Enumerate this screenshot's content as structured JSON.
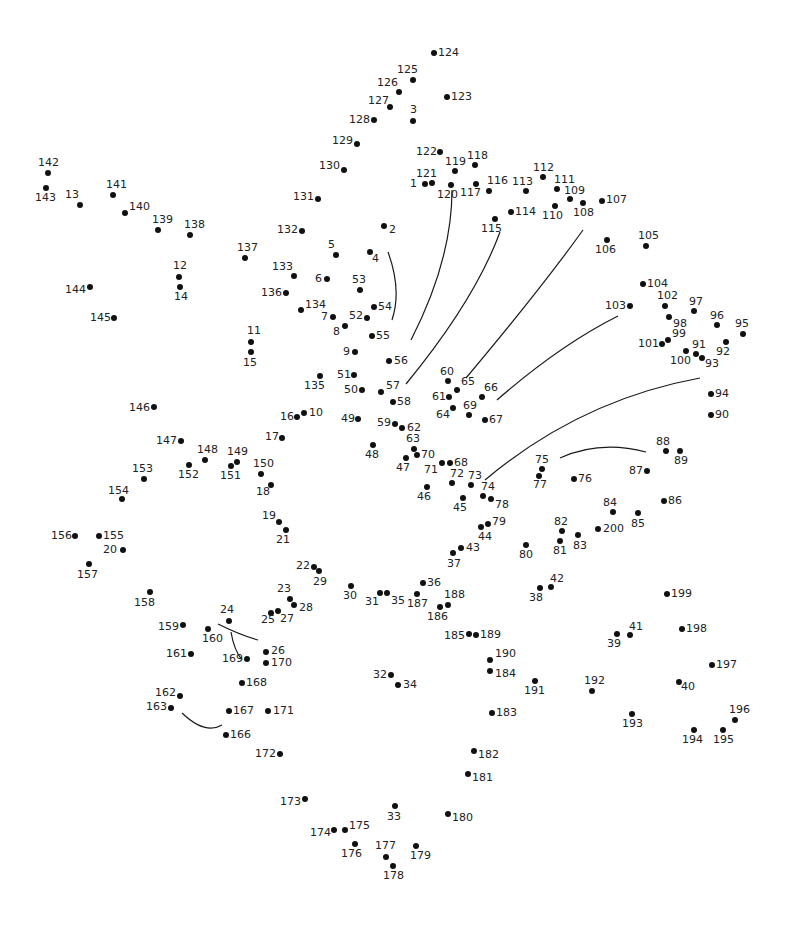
{
  "puzzle": {
    "type": "connect-the-dots",
    "total_points": 200,
    "dot_color": "#111111",
    "line_color": "#1a1a1a",
    "background": "#ffffff"
  },
  "points": [
    {
      "n": "1",
      "x": 425,
      "y": 184,
      "lx": -15,
      "ly": -6
    },
    {
      "n": "2",
      "x": 384,
      "y": 226,
      "lx": 5,
      "ly": -2
    },
    {
      "n": "3",
      "x": 413,
      "y": 121,
      "lx": -3,
      "ly": -17
    },
    {
      "n": "4",
      "x": 370,
      "y": 252,
      "lx": 2,
      "ly": 1
    },
    {
      "n": "5",
      "x": 336,
      "y": 255,
      "lx": -8,
      "ly": -16
    },
    {
      "n": "6",
      "x": 327,
      "y": 279,
      "lx": -12,
      "ly": -6
    },
    {
      "n": "7",
      "x": 333,
      "y": 317,
      "lx": -12,
      "ly": -6
    },
    {
      "n": "8",
      "x": 345,
      "y": 326,
      "lx": -12,
      "ly": 0
    },
    {
      "n": "9",
      "x": 355,
      "y": 352,
      "lx": -12,
      "ly": -6
    },
    {
      "n": "10",
      "x": 304,
      "y": 413,
      "lx": 5,
      "ly": -6
    },
    {
      "n": "11",
      "x": 251,
      "y": 342,
      "lx": -4,
      "ly": -17
    },
    {
      "n": "12",
      "x": 179,
      "y": 277,
      "lx": -6,
      "ly": -17
    },
    {
      "n": "13",
      "x": 80,
      "y": 205,
      "lx": -15,
      "ly": -16
    },
    {
      "n": "14",
      "x": 180,
      "y": 287,
      "lx": -6,
      "ly": 4
    },
    {
      "n": "15",
      "x": 251,
      "y": 352,
      "lx": -8,
      "ly": 5
    },
    {
      "n": "16",
      "x": 297,
      "y": 417,
      "lx": -17,
      "ly": -6
    },
    {
      "n": "17",
      "x": 282,
      "y": 438,
      "lx": -17,
      "ly": -7
    },
    {
      "n": "18",
      "x": 271,
      "y": 485,
      "lx": -15,
      "ly": 1
    },
    {
      "n": "19",
      "x": 279,
      "y": 522,
      "lx": -17,
      "ly": -12
    },
    {
      "n": "20",
      "x": 123,
      "y": 550,
      "lx": -20,
      "ly": -6
    },
    {
      "n": "21",
      "x": 286,
      "y": 530,
      "lx": -10,
      "ly": 4
    },
    {
      "n": "22",
      "x": 314,
      "y": 567,
      "lx": -18,
      "ly": -7
    },
    {
      "n": "23",
      "x": 290,
      "y": 599,
      "lx": -13,
      "ly": -16
    },
    {
      "n": "24",
      "x": 229,
      "y": 621,
      "lx": -9,
      "ly": -17
    },
    {
      "n": "25",
      "x": 271,
      "y": 613,
      "lx": -10,
      "ly": 1
    },
    {
      "n": "26",
      "x": 266,
      "y": 652,
      "lx": 5,
      "ly": -7
    },
    {
      "n": "27",
      "x": 278,
      "y": 611,
      "lx": 2,
      "ly": 2
    },
    {
      "n": "28",
      "x": 294,
      "y": 605,
      "lx": 5,
      "ly": -3
    },
    {
      "n": "29",
      "x": 319,
      "y": 571,
      "lx": -6,
      "ly": 5
    },
    {
      "n": "30",
      "x": 351,
      "y": 586,
      "lx": -8,
      "ly": 4
    },
    {
      "n": "31",
      "x": 380,
      "y": 593,
      "lx": -15,
      "ly": 3
    },
    {
      "n": "32",
      "x": 391,
      "y": 675,
      "lx": -18,
      "ly": -6
    },
    {
      "n": "33",
      "x": 395,
      "y": 806,
      "lx": -8,
      "ly": 5
    },
    {
      "n": "34",
      "x": 398,
      "y": 685,
      "lx": 5,
      "ly": -6
    },
    {
      "n": "35",
      "x": 387,
      "y": 593,
      "lx": 4,
      "ly": 2
    },
    {
      "n": "36",
      "x": 423,
      "y": 583,
      "lx": 4,
      "ly": -6
    },
    {
      "n": "37",
      "x": 453,
      "y": 553,
      "lx": -6,
      "ly": 5
    },
    {
      "n": "38",
      "x": 540,
      "y": 588,
      "lx": -11,
      "ly": 4
    },
    {
      "n": "39",
      "x": 617,
      "y": 634,
      "lx": -10,
      "ly": 4
    },
    {
      "n": "40",
      "x": 679,
      "y": 682,
      "lx": 2,
      "ly": -1
    },
    {
      "n": "41",
      "x": 630,
      "y": 635,
      "lx": -1,
      "ly": -14
    },
    {
      "n": "42",
      "x": 551,
      "y": 587,
      "lx": -1,
      "ly": -14
    },
    {
      "n": "43",
      "x": 461,
      "y": 548,
      "lx": 5,
      "ly": -6
    },
    {
      "n": "44",
      "x": 481,
      "y": 527,
      "lx": -3,
      "ly": 4
    },
    {
      "n": "45",
      "x": 463,
      "y": 498,
      "lx": -10,
      "ly": 4
    },
    {
      "n": "46",
      "x": 427,
      "y": 487,
      "lx": -10,
      "ly": 4
    },
    {
      "n": "47",
      "x": 406,
      "y": 458,
      "lx": -10,
      "ly": 4
    },
    {
      "n": "48",
      "x": 373,
      "y": 445,
      "lx": -8,
      "ly": 4
    },
    {
      "n": "49",
      "x": 358,
      "y": 419,
      "lx": -17,
      "ly": -6
    },
    {
      "n": "50",
      "x": 362,
      "y": 390,
      "lx": -18,
      "ly": -6
    },
    {
      "n": "51",
      "x": 354,
      "y": 375,
      "lx": -17,
      "ly": -6
    },
    {
      "n": "52",
      "x": 367,
      "y": 318,
      "lx": -18,
      "ly": -8
    },
    {
      "n": "53",
      "x": 360,
      "y": 290,
      "lx": -8,
      "ly": -16
    },
    {
      "n": "54",
      "x": 374,
      "y": 307,
      "lx": 4,
      "ly": -6
    },
    {
      "n": "55",
      "x": 372,
      "y": 336,
      "lx": 4,
      "ly": -6
    },
    {
      "n": "56",
      "x": 389,
      "y": 361,
      "lx": 5,
      "ly": -6
    },
    {
      "n": "57",
      "x": 381,
      "y": 392,
      "lx": 5,
      "ly": -12
    },
    {
      "n": "58",
      "x": 393,
      "y": 402,
      "lx": 4,
      "ly": -6
    },
    {
      "n": "59",
      "x": 395,
      "y": 424,
      "lx": -18,
      "ly": -7
    },
    {
      "n": "60",
      "x": 448,
      "y": 381,
      "lx": -8,
      "ly": -15
    },
    {
      "n": "61",
      "x": 449,
      "y": 397,
      "lx": -17,
      "ly": -6
    },
    {
      "n": "62",
      "x": 402,
      "y": 428,
      "lx": 5,
      "ly": -6
    },
    {
      "n": "63",
      "x": 414,
      "y": 449,
      "lx": -8,
      "ly": -16
    },
    {
      "n": "64",
      "x": 453,
      "y": 408,
      "lx": -17,
      "ly": 1
    },
    {
      "n": "65",
      "x": 457,
      "y": 390,
      "lx": 4,
      "ly": -14
    },
    {
      "n": "66",
      "x": 482,
      "y": 397,
      "lx": 2,
      "ly": -15
    },
    {
      "n": "67",
      "x": 485,
      "y": 420,
      "lx": 4,
      "ly": -6
    },
    {
      "n": "68",
      "x": 450,
      "y": 463,
      "lx": 4,
      "ly": -6
    },
    {
      "n": "69",
      "x": 469,
      "y": 415,
      "lx": -6,
      "ly": -15
    },
    {
      "n": "70",
      "x": 417,
      "y": 455,
      "lx": 4,
      "ly": -6
    },
    {
      "n": "71",
      "x": 442,
      "y": 463,
      "lx": -18,
      "ly": 1
    },
    {
      "n": "72",
      "x": 452,
      "y": 483,
      "lx": -2,
      "ly": -15
    },
    {
      "n": "73",
      "x": 471,
      "y": 485,
      "lx": -3,
      "ly": -15
    },
    {
      "n": "74",
      "x": 483,
      "y": 496,
      "lx": -2,
      "ly": -15
    },
    {
      "n": "75",
      "x": 542,
      "y": 469,
      "lx": -7,
      "ly": -15
    },
    {
      "n": "76",
      "x": 574,
      "y": 479,
      "lx": 4,
      "ly": -6
    },
    {
      "n": "77",
      "x": 539,
      "y": 476,
      "lx": -6,
      "ly": 3
    },
    {
      "n": "78",
      "x": 491,
      "y": 499,
      "lx": 4,
      "ly": 0
    },
    {
      "n": "79",
      "x": 488,
      "y": 524,
      "lx": 4,
      "ly": -8
    },
    {
      "n": "80",
      "x": 526,
      "y": 545,
      "lx": -7,
      "ly": 4
    },
    {
      "n": "81",
      "x": 560,
      "y": 541,
      "lx": -7,
      "ly": 4
    },
    {
      "n": "82",
      "x": 562,
      "y": 531,
      "lx": -8,
      "ly": -15
    },
    {
      "n": "83",
      "x": 578,
      "y": 535,
      "lx": -5,
      "ly": 5
    },
    {
      "n": "84",
      "x": 613,
      "y": 512,
      "lx": -10,
      "ly": -15
    },
    {
      "n": "85",
      "x": 638,
      "y": 513,
      "lx": -7,
      "ly": 5
    },
    {
      "n": "86",
      "x": 664,
      "y": 501,
      "lx": 4,
      "ly": -6
    },
    {
      "n": "87",
      "x": 647,
      "y": 471,
      "lx": -18,
      "ly": -6
    },
    {
      "n": "88",
      "x": 666,
      "y": 451,
      "lx": -10,
      "ly": -15
    },
    {
      "n": "89",
      "x": 680,
      "y": 451,
      "lx": -6,
      "ly": 4
    },
    {
      "n": "90",
      "x": 711,
      "y": 415,
      "lx": 4,
      "ly": -6
    },
    {
      "n": "91",
      "x": 696,
      "y": 354,
      "lx": -4,
      "ly": -15
    },
    {
      "n": "92",
      "x": 726,
      "y": 342,
      "lx": -10,
      "ly": 4
    },
    {
      "n": "93",
      "x": 702,
      "y": 358,
      "lx": 3,
      "ly": 0
    },
    {
      "n": "94",
      "x": 711,
      "y": 394,
      "lx": 4,
      "ly": -6
    },
    {
      "n": "95",
      "x": 743,
      "y": 334,
      "lx": -8,
      "ly": -16
    },
    {
      "n": "96",
      "x": 717,
      "y": 325,
      "lx": -7,
      "ly": -15
    },
    {
      "n": "97",
      "x": 694,
      "y": 311,
      "lx": -5,
      "ly": -15
    },
    {
      "n": "98",
      "x": 669,
      "y": 317,
      "lx": 4,
      "ly": 1
    },
    {
      "n": "99",
      "x": 668,
      "y": 340,
      "lx": 4,
      "ly": -12
    },
    {
      "n": "100",
      "x": 686,
      "y": 351,
      "lx": -16,
      "ly": 4
    },
    {
      "n": "101",
      "x": 662,
      "y": 344,
      "lx": -24,
      "ly": -6
    },
    {
      "n": "102",
      "x": 665,
      "y": 306,
      "lx": -8,
      "ly": -16
    },
    {
      "n": "103",
      "x": 630,
      "y": 306,
      "lx": -25,
      "ly": -6
    },
    {
      "n": "104",
      "x": 643,
      "y": 284,
      "lx": 4,
      "ly": -6
    },
    {
      "n": "105",
      "x": 646,
      "y": 246,
      "lx": -8,
      "ly": -16
    },
    {
      "n": "106",
      "x": 607,
      "y": 240,
      "lx": -12,
      "ly": 4
    },
    {
      "n": "107",
      "x": 602,
      "y": 201,
      "lx": 4,
      "ly": -7
    },
    {
      "n": "108",
      "x": 583,
      "y": 203,
      "lx": -10,
      "ly": 4
    },
    {
      "n": "109",
      "x": 570,
      "y": 199,
      "lx": -6,
      "ly": -14
    },
    {
      "n": "110",
      "x": 555,
      "y": 206,
      "lx": -13,
      "ly": 4
    },
    {
      "n": "111",
      "x": 557,
      "y": 189,
      "lx": -3,
      "ly": -15
    },
    {
      "n": "112",
      "x": 543,
      "y": 177,
      "lx": -10,
      "ly": -15
    },
    {
      "n": "113",
      "x": 526,
      "y": 191,
      "lx": -14,
      "ly": -15
    },
    {
      "n": "114",
      "x": 511,
      "y": 212,
      "lx": 4,
      "ly": -6
    },
    {
      "n": "115",
      "x": 495,
      "y": 219,
      "lx": -14,
      "ly": 4
    },
    {
      "n": "116",
      "x": 489,
      "y": 191,
      "lx": -2,
      "ly": -16
    },
    {
      "n": "117",
      "x": 476,
      "y": 184,
      "lx": -16,
      "ly": 3
    },
    {
      "n": "118",
      "x": 475,
      "y": 165,
      "lx": -8,
      "ly": -15
    },
    {
      "n": "119",
      "x": 455,
      "y": 171,
      "lx": -10,
      "ly": -15
    },
    {
      "n": "120",
      "x": 451,
      "y": 185,
      "lx": -14,
      "ly": 4
    },
    {
      "n": "121",
      "x": 432,
      "y": 183,
      "lx": -16,
      "ly": -15
    },
    {
      "n": "122",
      "x": 440,
      "y": 152,
      "lx": -24,
      "ly": -6
    },
    {
      "n": "123",
      "x": 447,
      "y": 97,
      "lx": 4,
      "ly": -6
    },
    {
      "n": "124",
      "x": 434,
      "y": 53,
      "lx": 4,
      "ly": -6
    },
    {
      "n": "125",
      "x": 413,
      "y": 80,
      "lx": -16,
      "ly": -16
    },
    {
      "n": "126",
      "x": 399,
      "y": 92,
      "lx": -22,
      "ly": -15
    },
    {
      "n": "127",
      "x": 390,
      "y": 107,
      "lx": -22,
      "ly": -12
    },
    {
      "n": "128",
      "x": 374,
      "y": 120,
      "lx": -25,
      "ly": -6
    },
    {
      "n": "129",
      "x": 357,
      "y": 144,
      "lx": -25,
      "ly": -9
    },
    {
      "n": "130",
      "x": 344,
      "y": 170,
      "lx": -25,
      "ly": -10
    },
    {
      "n": "131",
      "x": 318,
      "y": 199,
      "lx": -25,
      "ly": -8
    },
    {
      "n": "132",
      "x": 302,
      "y": 231,
      "lx": -25,
      "ly": -7
    },
    {
      "n": "133",
      "x": 294,
      "y": 276,
      "lx": -22,
      "ly": -15
    },
    {
      "n": "134",
      "x": 301,
      "y": 310,
      "lx": 4,
      "ly": -11
    },
    {
      "n": "135",
      "x": 320,
      "y": 376,
      "lx": -16,
      "ly": 4
    },
    {
      "n": "136",
      "x": 286,
      "y": 293,
      "lx": -25,
      "ly": -6
    },
    {
      "n": "137",
      "x": 245,
      "y": 258,
      "lx": -8,
      "ly": -16
    },
    {
      "n": "138",
      "x": 190,
      "y": 235,
      "lx": -6,
      "ly": -16
    },
    {
      "n": "139",
      "x": 158,
      "y": 230,
      "lx": -6,
      "ly": -16
    },
    {
      "n": "140",
      "x": 125,
      "y": 213,
      "lx": 4,
      "ly": -12
    },
    {
      "n": "141",
      "x": 113,
      "y": 195,
      "lx": -7,
      "ly": -16
    },
    {
      "n": "142",
      "x": 48,
      "y": 173,
      "lx": -10,
      "ly": -16
    },
    {
      "n": "143",
      "x": 46,
      "y": 188,
      "lx": -11,
      "ly": 4
    },
    {
      "n": "144",
      "x": 90,
      "y": 287,
      "lx": -25,
      "ly": -3
    },
    {
      "n": "145",
      "x": 114,
      "y": 318,
      "lx": -24,
      "ly": -6
    },
    {
      "n": "146",
      "x": 154,
      "y": 407,
      "lx": -25,
      "ly": -5
    },
    {
      "n": "147",
      "x": 181,
      "y": 441,
      "lx": -25,
      "ly": -6
    },
    {
      "n": "148",
      "x": 205,
      "y": 460,
      "lx": -8,
      "ly": -16
    },
    {
      "n": "149",
      "x": 237,
      "y": 462,
      "lx": -10,
      "ly": -16
    },
    {
      "n": "150",
      "x": 261,
      "y": 474,
      "lx": -8,
      "ly": -16
    },
    {
      "n": "151",
      "x": 231,
      "y": 466,
      "lx": -11,
      "ly": 4
    },
    {
      "n": "152",
      "x": 189,
      "y": 465,
      "lx": -11,
      "ly": 4
    },
    {
      "n": "153",
      "x": 144,
      "y": 479,
      "lx": -12,
      "ly": -16
    },
    {
      "n": "154",
      "x": 122,
      "y": 499,
      "lx": -14,
      "ly": -14
    },
    {
      "n": "155",
      "x": 99,
      "y": 536,
      "lx": 4,
      "ly": -6
    },
    {
      "n": "156",
      "x": 75,
      "y": 536,
      "lx": -24,
      "ly": -6
    },
    {
      "n": "157",
      "x": 89,
      "y": 564,
      "lx": -12,
      "ly": 5
    },
    {
      "n": "158",
      "x": 150,
      "y": 592,
      "lx": -16,
      "ly": 5
    },
    {
      "n": "159",
      "x": 183,
      "y": 625,
      "lx": -25,
      "ly": -4
    },
    {
      "n": "160",
      "x": 208,
      "y": 629,
      "lx": -6,
      "ly": 4
    },
    {
      "n": "161",
      "x": 191,
      "y": 654,
      "lx": -25,
      "ly": -6
    },
    {
      "n": "162",
      "x": 180,
      "y": 696,
      "lx": -25,
      "ly": -9
    },
    {
      "n": "163",
      "x": 171,
      "y": 708,
      "lx": -25,
      "ly": -7
    },
    {
      "n": "164",
      "x": -100,
      "y": -100,
      "lx": 0,
      "ly": 0
    },
    {
      "n": "165",
      "x": -100,
      "y": -100,
      "lx": 0,
      "ly": 0
    },
    {
      "n": "166",
      "x": 226,
      "y": 735,
      "lx": 4,
      "ly": -6
    },
    {
      "n": "167",
      "x": 229,
      "y": 711,
      "lx": 4,
      "ly": -6
    },
    {
      "n": "168",
      "x": 242,
      "y": 683,
      "lx": 4,
      "ly": -6
    },
    {
      "n": "169",
      "x": 247,
      "y": 659,
      "lx": -25,
      "ly": -6
    },
    {
      "n": "170",
      "x": 266,
      "y": 663,
      "lx": 5,
      "ly": -6
    },
    {
      "n": "171",
      "x": 268,
      "y": 711,
      "lx": 5,
      "ly": -6
    },
    {
      "n": "172",
      "x": 280,
      "y": 754,
      "lx": -25,
      "ly": -6
    },
    {
      "n": "173",
      "x": 305,
      "y": 799,
      "lx": -25,
      "ly": -3
    },
    {
      "n": "174",
      "x": 334,
      "y": 830,
      "lx": -24,
      "ly": -3
    },
    {
      "n": "175",
      "x": 345,
      "y": 830,
      "lx": 4,
      "ly": -10
    },
    {
      "n": "176",
      "x": 355,
      "y": 844,
      "lx": -14,
      "ly": 4
    },
    {
      "n": "177",
      "x": 386,
      "y": 857,
      "lx": -11,
      "ly": -17
    },
    {
      "n": "178",
      "x": 393,
      "y": 866,
      "lx": -10,
      "ly": 4
    },
    {
      "n": "179",
      "x": 416,
      "y": 846,
      "lx": -6,
      "ly": 4
    },
    {
      "n": "180",
      "x": 448,
      "y": 814,
      "lx": 4,
      "ly": -2
    },
    {
      "n": "181",
      "x": 468,
      "y": 774,
      "lx": 4,
      "ly": -2
    },
    {
      "n": "182",
      "x": 474,
      "y": 751,
      "lx": 4,
      "ly": -2
    },
    {
      "n": "183",
      "x": 492,
      "y": 713,
      "lx": 4,
      "ly": -6
    },
    {
      "n": "184",
      "x": 490,
      "y": 671,
      "lx": 5,
      "ly": -3
    },
    {
      "n": "185",
      "x": 469,
      "y": 634,
      "lx": -25,
      "ly": -4
    },
    {
      "n": "186",
      "x": 440,
      "y": 607,
      "lx": -13,
      "ly": 4
    },
    {
      "n": "187",
      "x": 417,
      "y": 594,
      "lx": -10,
      "ly": 4
    },
    {
      "n": "188",
      "x": 448,
      "y": 605,
      "lx": -4,
      "ly": -16
    },
    {
      "n": "189",
      "x": 476,
      "y": 635,
      "lx": 4,
      "ly": -6
    },
    {
      "n": "190",
      "x": 490,
      "y": 660,
      "lx": 5,
      "ly": -12
    },
    {
      "n": "191",
      "x": 535,
      "y": 681,
      "lx": -11,
      "ly": 4
    },
    {
      "n": "192",
      "x": 592,
      "y": 691,
      "lx": -8,
      "ly": -16
    },
    {
      "n": "193",
      "x": 632,
      "y": 714,
      "lx": -10,
      "ly": 4
    },
    {
      "n": "194",
      "x": 694,
      "y": 730,
      "lx": -12,
      "ly": 4
    },
    {
      "n": "195",
      "x": 723,
      "y": 730,
      "lx": -10,
      "ly": 4
    },
    {
      "n": "196",
      "x": 735,
      "y": 720,
      "lx": -6,
      "ly": -16
    },
    {
      "n": "197",
      "x": 712,
      "y": 665,
      "lx": 4,
      "ly": -6
    },
    {
      "n": "198",
      "x": 682,
      "y": 629,
      "lx": 4,
      "ly": -6
    },
    {
      "n": "199",
      "x": 667,
      "y": 594,
      "lx": 4,
      "ly": -6
    },
    {
      "n": "200",
      "x": 598,
      "y": 529,
      "lx": 5,
      "ly": -6
    }
  ],
  "guide_curves": [
    "M 388 252 Q 402 290 392 320",
    "M 411 340 Q 452 260 452 190",
    "M 406 384 Q 475 300 500 232",
    "M 466 378 Q 540 290 583 230",
    "M 497 400 Q 560 345 618 316",
    "M 485 480 Q 580 400 700 378",
    "M 560 458 Q 600 440 646 452",
    "M 218 624 Q 240 635 258 640",
    "M 231 632 Q 234 650 242 660",
    "M 182 713 Q 205 735 222 725"
  ]
}
